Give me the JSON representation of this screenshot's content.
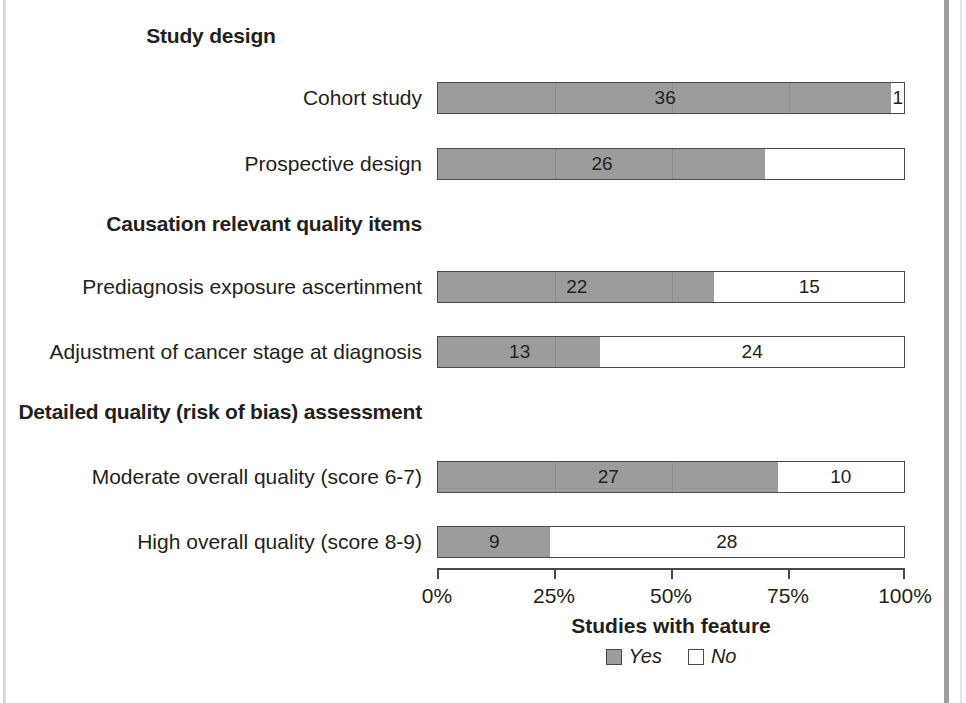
{
  "chart_data": {
    "type": "bar",
    "orientation": "horizontal",
    "stacked": true,
    "title": "",
    "xlabel": "Studies with feature",
    "ylabel": "",
    "xlim": [
      0,
      100
    ],
    "xticks": [
      "0%",
      "25%",
      "50%",
      "75%",
      "100%"
    ],
    "xtick_values": [
      0,
      25,
      50,
      75,
      100
    ],
    "grid": false,
    "legend_position": "bottom",
    "total_studies": 37,
    "series": [
      {
        "name": "Yes",
        "color": "#9c9c9c",
        "values": [
          36,
          26,
          22,
          13,
          27,
          9
        ]
      },
      {
        "name": "No",
        "color": "#ffffff",
        "values": [
          1,
          11,
          15,
          24,
          10,
          28
        ]
      }
    ],
    "categories": [
      "Cohort study",
      "Prospective design",
      "Prediagnosis exposure ascertinment",
      "Adjustment of cancer stage at diagnosis",
      "Moderate overall quality (score 6-7)",
      "High overall quality (score 8-9)"
    ],
    "sections": [
      {
        "heading": "Study design",
        "rows": [
          0,
          1
        ]
      },
      {
        "heading": "Causation relevant quality items",
        "rows": [
          2,
          3
        ]
      },
      {
        "heading": "Detailed quality (risk of bias) assessment",
        "rows": [
          4,
          5
        ]
      }
    ]
  },
  "sections": [
    {
      "heading": "Study design",
      "heading_align": "center",
      "heading_top": 24,
      "rows": [
        {
          "label": "Cohort study",
          "top": 81,
          "yes_value": "36",
          "no_value": "1",
          "yes_pct": 97.3,
          "no_pct": 2.7
        },
        {
          "label": "Prospective design",
          "top": 147,
          "yes_value": "26",
          "no_value": "",
          "yes_pct": 70.3,
          "no_pct": 29.7
        }
      ]
    },
    {
      "heading": "Causation relevant quality items",
      "heading_align": "right",
      "heading_top": 212,
      "rows": [
        {
          "label": "Prediagnosis exposure ascertinment",
          "top": 270,
          "yes_value": "22",
          "no_value": "15",
          "yes_pct": 59.5,
          "no_pct": 40.5
        },
        {
          "label": "Adjustment of cancer stage at diagnosis",
          "top": 335,
          "yes_value": "13",
          "no_value": "24",
          "yes_pct": 35.1,
          "no_pct": 64.9
        }
      ]
    },
    {
      "heading": "Detailed quality (risk of bias) assessment",
      "heading_align": "right",
      "heading_top": 400,
      "rows": [
        {
          "label": "Moderate overall quality (score 6-7)",
          "top": 460,
          "yes_value": "27",
          "no_value": "10",
          "yes_pct": 73.0,
          "no_pct": 27.0
        },
        {
          "label": "High overall quality (score 8-9)",
          "top": 525,
          "yes_value": "9",
          "no_value": "28",
          "yes_pct": 24.3,
          "no_pct": 75.7
        }
      ]
    }
  ],
  "axis": {
    "ticks": [
      {
        "label": "0%",
        "pct": 0
      },
      {
        "label": "25%",
        "pct": 25
      },
      {
        "label": "50%",
        "pct": 50
      },
      {
        "label": "75%",
        "pct": 75
      },
      {
        "label": "100%",
        "pct": 100
      }
    ],
    "title": "Studies with feature"
  },
  "legend": {
    "items": [
      {
        "label": "Yes",
        "swatch": "yes"
      },
      {
        "label": "No",
        "swatch": "no"
      }
    ]
  },
  "colors": {
    "bar_yes": "#9c9c9c",
    "bar_no": "#ffffff",
    "outline": "#4a4a4a",
    "text": "#231f20"
  }
}
